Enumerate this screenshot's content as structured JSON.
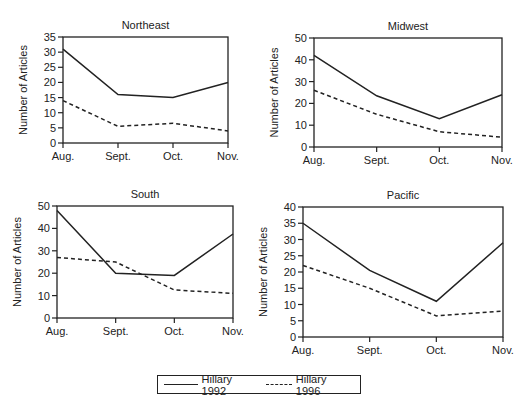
{
  "chart_data": [
    {
      "type": "line",
      "title": "Northeast",
      "xlabel": "",
      "ylabel": "Number of Articles",
      "categories": [
        "Aug.",
        "Sept.",
        "Oct.",
        "Nov."
      ],
      "ylim": [
        0,
        35
      ],
      "yticks": [
        0,
        5,
        10,
        15,
        20,
        25,
        30,
        35
      ],
      "series": [
        {
          "name": "Hillary 1992",
          "style": "solid",
          "values": [
            31,
            16,
            15,
            20
          ]
        },
        {
          "name": "Hillary 1996",
          "style": "dashed",
          "values": [
            14,
            5.5,
            6.5,
            4
          ]
        }
      ],
      "box": {
        "x0": 63,
        "x1": 228,
        "ytop": 37,
        "ybot": 143
      }
    },
    {
      "type": "line",
      "title": "Midwest",
      "xlabel": "",
      "ylabel": "Number of Articles",
      "categories": [
        "Aug.",
        "Sept.",
        "Oct.",
        "Nov."
      ],
      "ylim": [
        0,
        50
      ],
      "yticks": [
        0,
        10,
        20,
        30,
        40,
        50
      ],
      "series": [
        {
          "name": "Hillary 1992",
          "style": "solid",
          "values": [
            42,
            23.5,
            13,
            24
          ]
        },
        {
          "name": "Hillary 1996",
          "style": "dashed",
          "values": [
            26,
            15,
            7,
            4.5
          ]
        }
      ],
      "box": {
        "x0": 314,
        "x1": 502,
        "ytop": 38,
        "ybot": 147
      }
    },
    {
      "type": "line",
      "title": "South",
      "xlabel": "",
      "ylabel": "Number of Articles",
      "categories": [
        "Aug.",
        "Sept.",
        "Oct.",
        "Nov."
      ],
      "ylim": [
        0,
        50
      ],
      "yticks": [
        0,
        10,
        20,
        30,
        40,
        50
      ],
      "series": [
        {
          "name": "Hillary 1992",
          "style": "solid",
          "values": [
            48,
            20,
            19,
            37.5
          ]
        },
        {
          "name": "Hillary 1996",
          "style": "dashed",
          "values": [
            27,
            25,
            12.5,
            11
          ]
        }
      ],
      "box": {
        "x0": 57,
        "x1": 233,
        "ytop": 206,
        "ybot": 318
      }
    },
    {
      "type": "line",
      "title": "Pacific",
      "xlabel": "",
      "ylabel": "Number of Articles",
      "categories": [
        "Aug.",
        "Sept.",
        "Oct.",
        "Nov."
      ],
      "ylim": [
        0,
        40
      ],
      "yticks": [
        0,
        5,
        10,
        15,
        20,
        25,
        30,
        35,
        40
      ],
      "series": [
        {
          "name": "Hillary 1992",
          "style": "solid",
          "values": [
            35,
            20.5,
            11,
            29
          ]
        },
        {
          "name": "Hillary 1996",
          "style": "dashed",
          "values": [
            22,
            15,
            6.5,
            8
          ]
        }
      ],
      "box": {
        "x0": 303,
        "x1": 503,
        "ytop": 207,
        "ybot": 337
      }
    }
  ],
  "legend": {
    "items": [
      {
        "label": "Hillary 1992",
        "style": "solid"
      },
      {
        "label": "Hillary 1996",
        "style": "dashed"
      }
    ]
  },
  "note": "Note: (partially visible, cut off at bottom of image)"
}
